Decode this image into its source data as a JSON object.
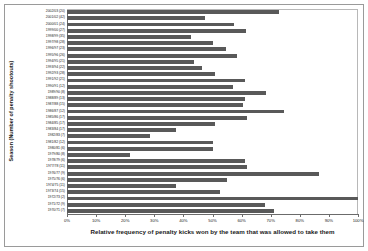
{
  "chart_data": {
    "type": "bar",
    "orientation": "horizontal",
    "title": "",
    "xlabel": "Relative frequency of penalty kicks won by the team that was allowed to take them",
    "ylabel": "Season (Number of penalty shootouts)",
    "xlim": [
      0,
      100
    ],
    "xunit": "%",
    "grid": false,
    "legend": null,
    "bar_color": "#595959",
    "categories": [
      "2002/03 (20)",
      "2001/02 (42)",
      "2000/01 (24)",
      "1999/00 (27)",
      "1998/99 (35)",
      "1997/98 (28)",
      "1996/97 (23)",
      "1995/96 (26)",
      "1994/95 (21)",
      "1993/94 (22)",
      "1992/93 (28)",
      "1991/92 (21)",
      "1990/91 (12)",
      "1989/90 (8)",
      "1988/89 (13)",
      "1987/88 (15)",
      "1986/87 (12)",
      "1985/86 (17)",
      "1984/85 (17)",
      "1983/84 (17)",
      "1982/83 (7)",
      "1981/82 (12)",
      "1980/81 (6)",
      "1979/80 (8)",
      "1978/79 (6)",
      "1977/78 (11)",
      "1976/77 (9)",
      "1975/76 (6)",
      "1974/75 (11)",
      "1973/74 (15)",
      "1972/73 (2)",
      "1971/72 (9)",
      "1970/71 (7)"
    ],
    "values": [
      73.0,
      47.5,
      57.5,
      61.5,
      42.5,
      50.0,
      54.5,
      58.5,
      43.5,
      46.5,
      51.0,
      61.0,
      57.0,
      68.5,
      61.0,
      60.5,
      74.5,
      62.0,
      51.0,
      37.5,
      28.5,
      50.0,
      50.0,
      21.5,
      61.0,
      62.0,
      86.5,
      55.0,
      37.5,
      52.5,
      100.0,
      68.0,
      71.0
    ],
    "xticks": [
      0,
      10,
      20,
      30,
      40,
      50,
      60,
      70,
      80,
      90,
      100
    ],
    "xticklabels": [
      "0%",
      "10%",
      "20%",
      "30%",
      "40%",
      "50%",
      "60%",
      "70%",
      "80%",
      "90%",
      "100%"
    ]
  }
}
